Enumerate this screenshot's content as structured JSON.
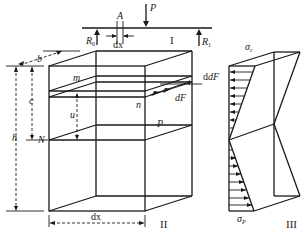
{
  "figure": {
    "part_I": {
      "label": "I",
      "load": "P",
      "left_support": "R",
      "left_support_sub": "0",
      "right_support": "R",
      "right_support_sub": "1",
      "section": "A",
      "element_width": "dx"
    },
    "part_II": {
      "label": "II",
      "width_label": "b",
      "height_label": "h",
      "depth_label": "c",
      "layer_distance": "u",
      "neutral_point": "N",
      "neutral_point_back": "P",
      "layer_top_point": "m",
      "layer_bottom_point": "n",
      "force_top": "dF",
      "force_bottom": "dF",
      "bottom_width": "dx"
    },
    "part_III": {
      "label": "III",
      "compressive_stress": "σ",
      "compressive_stress_sub": "c",
      "tensile_stress": "σ",
      "tensile_stress_sub": "P"
    }
  }
}
